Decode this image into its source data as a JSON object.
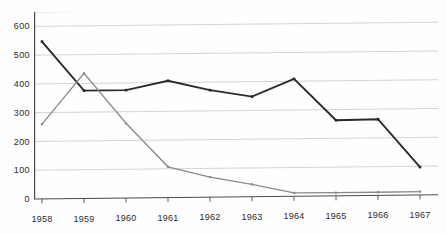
{
  "title_remnant": "· ·· · ··· ··  ··· · ·",
  "axis": {
    "y_ticks": [
      "0",
      "100",
      "200",
      "300",
      "400",
      "500",
      "600"
    ],
    "x_ticks": [
      "1958",
      "1959",
      "1960",
      "1961",
      "1962",
      "1963",
      "1964",
      "1965",
      "1966",
      "1967"
    ]
  },
  "colors": {
    "series_dark": "#2a2a2a",
    "series_gray": "#8a8a8a",
    "gridline": "#c9c9c9",
    "axis": "#4a4a4a",
    "background": "#fefefe",
    "text": "#2b2b2b"
  },
  "chart_data": {
    "type": "line",
    "title": "",
    "xlabel": "",
    "ylabel": "",
    "x": [
      "1958",
      "1959",
      "1960",
      "1961",
      "1962",
      "1963",
      "1964",
      "1965",
      "1966",
      "1967"
    ],
    "categories": [
      "1958",
      "1959",
      "1960",
      "1961",
      "1962",
      "1963",
      "1964",
      "1965",
      "1966",
      "1967"
    ],
    "xlim": [
      1958,
      1967
    ],
    "ylim": [
      0,
      650
    ],
    "yticks": [
      0,
      100,
      200,
      300,
      400,
      500,
      600
    ],
    "gridlines": [
      0,
      100,
      200,
      300,
      400,
      500,
      600,
      650
    ],
    "grid": true,
    "legend": null,
    "legend_position": "none",
    "markers": "square",
    "series": [
      {
        "name": "series-dark",
        "color": "#2a2a2a",
        "width": 1.9,
        "values": [
          547,
          375,
          375,
          406,
          372,
          348,
          408,
          263,
          265,
          97
        ]
      },
      {
        "name": "series-gray",
        "color": "#8a8a8a",
        "width": 1.3,
        "values": [
          260,
          435,
          260,
          107,
          70,
          43,
          12,
          11,
          11,
          12
        ]
      }
    ]
  }
}
